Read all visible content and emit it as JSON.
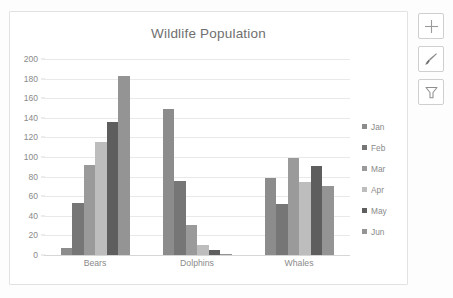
{
  "chart_data": {
    "type": "bar",
    "title": "Wildlife Population",
    "xlabel": "",
    "ylabel": "",
    "ylim": [
      0,
      200
    ],
    "ytick_step": 20,
    "yticks": [
      200,
      180,
      160,
      140,
      120,
      100,
      80,
      60,
      40,
      20,
      0
    ],
    "grid": true,
    "legend_position": "right",
    "categories": [
      "Bears",
      "Dolphins",
      "Whales"
    ],
    "series": [
      {
        "name": "Jan",
        "color": "#8c8c8c",
        "values": [
          7,
          149,
          79
        ]
      },
      {
        "name": "Feb",
        "color": "#767676",
        "values": [
          53,
          76,
          52
        ]
      },
      {
        "name": "Mar",
        "color": "#9a9a9a",
        "values": [
          92,
          31,
          99
        ]
      },
      {
        "name": "Apr",
        "color": "#bdbdbd",
        "values": [
          115,
          10,
          75
        ]
      },
      {
        "name": "May",
        "color": "#5e5e5e",
        "values": [
          136,
          5,
          91
        ]
      },
      {
        "name": "Jun",
        "color": "#949494",
        "values": [
          183,
          1,
          70
        ]
      }
    ]
  },
  "chart_buttons": [
    {
      "name": "chart-elements",
      "icon": "plus-icon"
    },
    {
      "name": "chart-styles",
      "icon": "brush-icon"
    },
    {
      "name": "chart-filters",
      "icon": "funnel-icon"
    }
  ],
  "colors": {
    "title_text": "#6f6f6f",
    "axis_text": "#8a8a8a",
    "gridline": "#e9e9e9",
    "frame_border": "#e2e2e2",
    "button_border": "#cfcfcf"
  }
}
